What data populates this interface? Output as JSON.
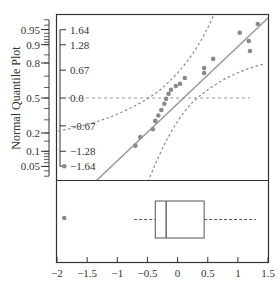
{
  "chart_data": {
    "type": "scatter",
    "title": "",
    "ylabel": "Normal Quantile Plot",
    "xlabel": "",
    "xlim": [
      -2,
      1.5
    ],
    "x_ticks": [
      -2,
      -1.5,
      -1,
      -0.5,
      0,
      0.5,
      1,
      1.5
    ],
    "x_tick_labels": [
      "-2",
      "-1.5",
      "-1",
      "-0.5",
      "0",
      "0.5",
      "1",
      "1.5"
    ],
    "probability_ticks": [
      "0.95",
      "0.9",
      "0.8",
      "0.5",
      "0.2",
      "0.1",
      "0.05"
    ],
    "quantile_ticks": [
      "1.64",
      "1.28",
      "0.67",
      "0.0",
      "-0.67",
      "-1.28",
      "-1.64"
    ],
    "quantile_plot": {
      "points": [
        {
          "x": -1.88,
          "q": -1.64
        },
        {
          "x": -0.7,
          "q": -1.15
        },
        {
          "x": -0.62,
          "q": -0.94
        },
        {
          "x": -0.41,
          "q": -0.75
        },
        {
          "x": -0.37,
          "q": -0.55
        },
        {
          "x": -0.32,
          "q": -0.42
        },
        {
          "x": -0.27,
          "q": -0.29
        },
        {
          "x": -0.22,
          "q": -0.14
        },
        {
          "x": -0.19,
          "q": -0.02
        },
        {
          "x": -0.15,
          "q": 0.1
        },
        {
          "x": -0.11,
          "q": 0.2
        },
        {
          "x": -0.03,
          "q": 0.29
        },
        {
          "x": 0.04,
          "q": 0.34
        },
        {
          "x": 0.12,
          "q": 0.48
        },
        {
          "x": 0.44,
          "q": 0.6
        },
        {
          "x": 0.44,
          "q": 0.72
        },
        {
          "x": 0.59,
          "q": 0.94
        },
        {
          "x": 1.03,
          "q": 1.57
        },
        {
          "x": 1.2,
          "q": 1.13
        },
        {
          "x": 1.18,
          "q": 1.37
        },
        {
          "x": 1.33,
          "q": 1.78
        }
      ],
      "fit_line": true,
      "confidence_bands": true,
      "reference_line_q": 0.0
    },
    "box_plot": {
      "whisker_low": -0.72,
      "q1": -0.37,
      "median": -0.19,
      "q3": 0.44,
      "whisker_high": 1.3,
      "outliers": [
        -1.88
      ]
    }
  }
}
